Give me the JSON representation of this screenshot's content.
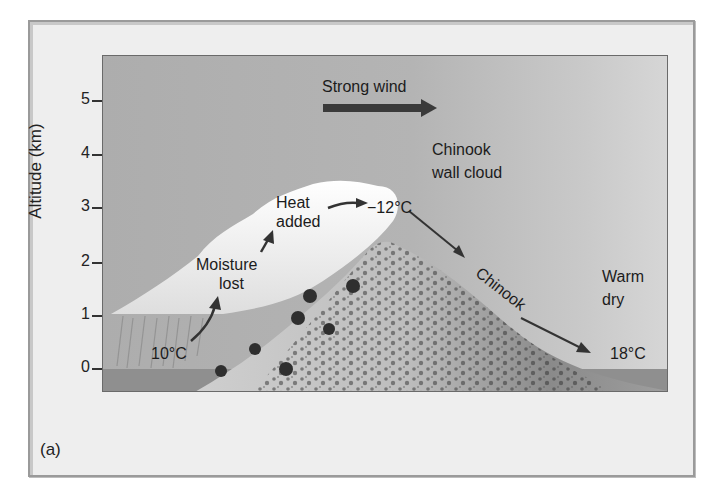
{
  "figure": {
    "panel_label": "(a)",
    "y_axis": {
      "title": "Altitude (km)",
      "ticks": [
        "5",
        "4",
        "3",
        "2",
        "1",
        "0"
      ]
    },
    "labels": {
      "strong_wind": "Strong wind",
      "chinook_wall_cloud_line1": "Chinook",
      "chinook_wall_cloud_line2": "wall cloud",
      "heat_added_line1": "Heat",
      "heat_added_line2": "added",
      "temp_top": "−12°C",
      "moisture_lost_line1": "Moisture",
      "moisture_lost_line2": "lost",
      "temp_windward": "10°C",
      "chinook": "Chinook",
      "warm_line1": "Warm",
      "warm_line2": "dry",
      "temp_leeward": "18°C"
    },
    "colors": {
      "sky": "#b0b0b0",
      "cloud": "#f4f4f4",
      "mountain_dark": "#4a4a4a",
      "mountain_light": "#d8d8d8",
      "arrow": "#333333",
      "frame_bg": "#eeeeee"
    }
  }
}
